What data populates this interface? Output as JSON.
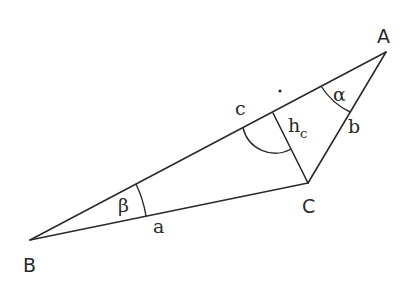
{
  "diagram": {
    "stroke_color": "#2a2a2a",
    "background": "#ffffff",
    "vertices": {
      "A": {
        "label": "A",
        "x": 386,
        "y": 52
      },
      "B": {
        "label": "B",
        "x": 30,
        "y": 240
      },
      "C": {
        "label": "C",
        "x": 308,
        "y": 183
      }
    },
    "sides": {
      "a": {
        "label": "a",
        "from": "B",
        "to": "C"
      },
      "b": {
        "label": "b",
        "from": "C",
        "to": "A"
      },
      "c": {
        "label": "c",
        "from": "B",
        "to": "A"
      }
    },
    "altitude": {
      "label_main": "h",
      "label_sub": "c",
      "from": "C",
      "foot": {
        "x": 273,
        "y": 113
      }
    },
    "angles": {
      "alpha": {
        "label": "α",
        "vertex": "A"
      },
      "beta": {
        "label": "β",
        "vertex": "B"
      },
      "right_angle_dot": {
        "x": 280,
        "y": 91
      }
    }
  }
}
